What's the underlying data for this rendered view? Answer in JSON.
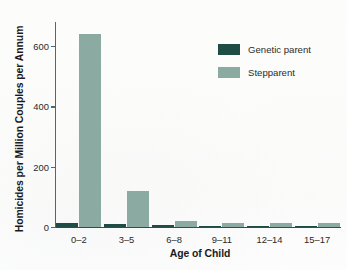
{
  "chart_data": {
    "type": "bar",
    "title": "",
    "xlabel": "Age of Child",
    "ylabel": "Homicides per Million Couples per Annum",
    "categories": [
      "0–2",
      "3–5",
      "6–8",
      "9–11",
      "12–14",
      "15–17"
    ],
    "series": [
      {
        "name": "Genetic parent",
        "color": "#1f4d45",
        "values": [
          14,
          10,
          7,
          2,
          2,
          1
        ]
      },
      {
        "name": "Stepparent",
        "color": "#8aaaa2",
        "values": [
          640,
          120,
          19,
          14,
          13,
          13
        ]
      }
    ],
    "ylim": [
      0,
      680
    ],
    "yticks": [
      0,
      200,
      400,
      600
    ],
    "ytick_labels": [
      "0",
      "200",
      "400",
      "600"
    ],
    "grid": false,
    "legend_position": "top-right"
  },
  "legend": {
    "items": [
      {
        "label": "Genetic parent"
      },
      {
        "label": "Stepparent"
      }
    ]
  }
}
